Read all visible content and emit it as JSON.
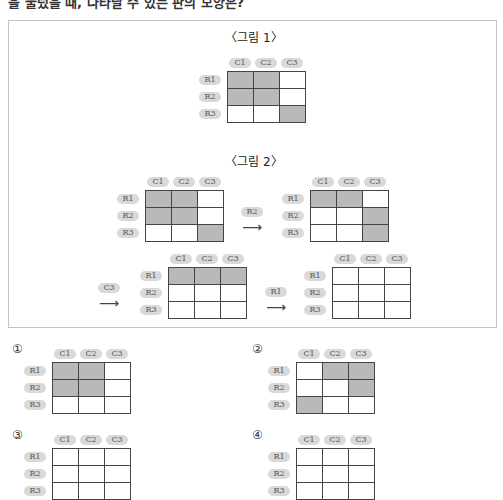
{
  "question": {
    "text": "을 눌렀을 때, 나타날 수 있는 판의 모양은?"
  },
  "colors": {
    "shaded": "#b9b9b9",
    "pill": "#d9d9d9",
    "border": "#444444"
  },
  "col_labels": [
    "C1",
    "C2",
    "C3"
  ],
  "row_labels": [
    "R1",
    "R2",
    "R3"
  ],
  "figure1": {
    "title": "〈그림 1〉",
    "grid": [
      [
        1,
        1,
        0
      ],
      [
        1,
        1,
        0
      ],
      [
        0,
        0,
        1
      ]
    ]
  },
  "figure2": {
    "title": "〈그림 2〉",
    "steps": [
      {
        "button": "",
        "grid": [
          [
            1,
            1,
            0
          ],
          [
            1,
            1,
            0
          ],
          [
            0,
            0,
            1
          ]
        ]
      },
      {
        "button": "R2",
        "grid": [
          [
            1,
            1,
            0
          ],
          [
            0,
            0,
            1
          ],
          [
            0,
            0,
            1
          ]
        ]
      },
      {
        "button": "C3",
        "grid": [
          [
            1,
            1,
            1
          ],
          [
            0,
            0,
            0
          ],
          [
            0,
            0,
            0
          ]
        ]
      },
      {
        "button": "R1",
        "grid": [
          [
            0,
            0,
            0
          ],
          [
            0,
            0,
            0
          ],
          [
            0,
            0,
            0
          ]
        ]
      }
    ],
    "arrow": "⟶"
  },
  "options": [
    {
      "marker": "①",
      "grid": [
        [
          1,
          1,
          0
        ],
        [
          1,
          1,
          0
        ],
        [
          0,
          0,
          0
        ]
      ]
    },
    {
      "marker": "②",
      "grid": [
        [
          0,
          1,
          1
        ],
        [
          0,
          0,
          1
        ],
        [
          1,
          0,
          0
        ]
      ]
    },
    {
      "marker": "③",
      "grid": null
    },
    {
      "marker": "④",
      "grid": null
    }
  ]
}
